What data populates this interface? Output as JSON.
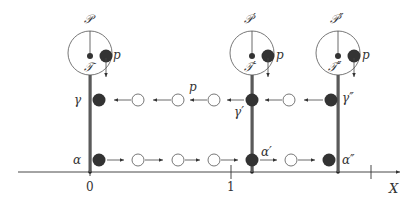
{
  "diagram": {
    "colors": {
      "ink": "#333333",
      "bar": "#555555",
      "filled_dot": "#333333",
      "hollow_dot": "#666666",
      "background": "#ffffff"
    },
    "axis": {
      "label": "X",
      "ticks": [
        {
          "label": "0"
        },
        {
          "label": "1"
        }
      ]
    },
    "columns": [
      {
        "process_label": "𝒫",
        "tree_label": "𝒯",
        "point_label": "p",
        "gamma_label": "γ",
        "alpha_label": "α"
      },
      {
        "process_label": "𝒫′",
        "tree_label": "𝒯′",
        "point_label": "p",
        "gamma_label": "γ′",
        "alpha_label": "α′"
      },
      {
        "process_label": "𝒫″",
        "tree_label": "𝒯″",
        "point_label": "p",
        "gamma_label": "γ″",
        "alpha_label": "α″"
      }
    ],
    "gamma_row_label": "p"
  }
}
